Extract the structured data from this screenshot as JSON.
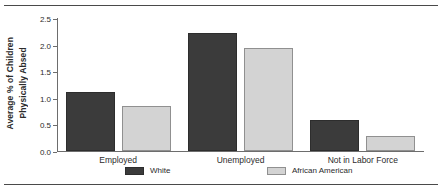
{
  "chart_data": {
    "type": "bar",
    "title": "",
    "xlabel": "",
    "ylabel": "Average % of Children Physically Absed",
    "ylabel_line1": "Average % of Children",
    "ylabel_line2": "Physically Absed",
    "categories": [
      "Employed",
      "Unemployed",
      "Not in Labor Force"
    ],
    "series": [
      {
        "name": "White",
        "color": "#3b3b3b",
        "values": [
          1.1,
          2.21,
          0.58
        ]
      },
      {
        "name": "African American",
        "color": "#d3d3d3",
        "values": [
          0.85,
          1.94,
          0.29
        ]
      }
    ],
    "ylim": [
      0.0,
      2.5
    ],
    "ytick_values": [
      0.0,
      0.5,
      1.0,
      1.5,
      2.0,
      2.5
    ],
    "ytick_labels": [
      "0.0",
      "0.5",
      "1.0",
      "1.5",
      "2.0",
      "2.5"
    ],
    "grid": false,
    "legend_position": "bottom"
  },
  "frame": {
    "top_rule": "",
    "bottom_rule": ""
  }
}
